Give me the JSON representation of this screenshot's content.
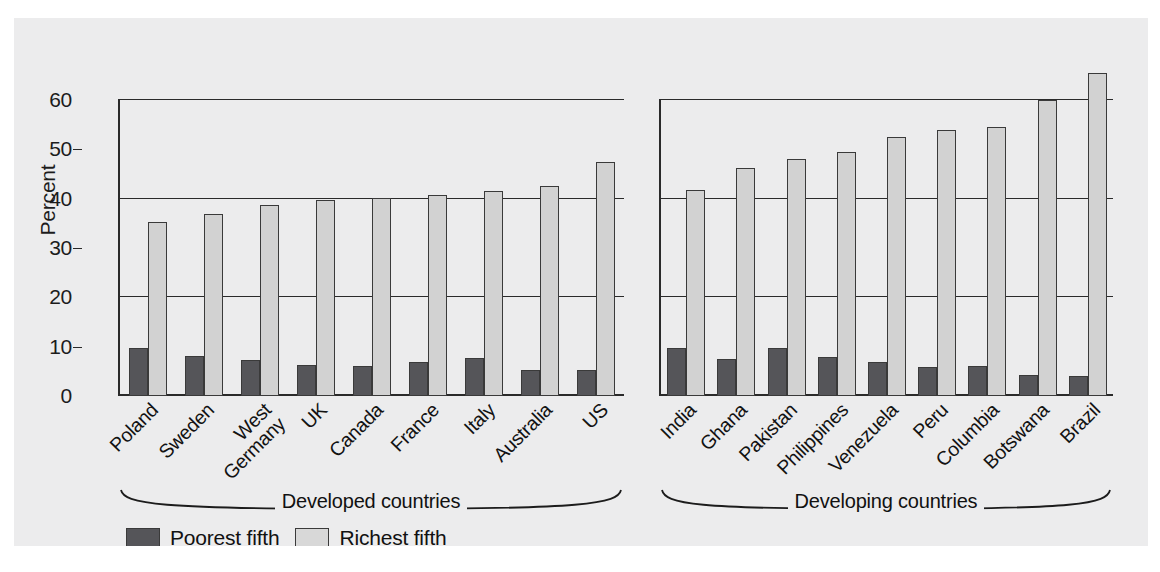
{
  "chart_data": {
    "type": "bar",
    "title": "",
    "xlabel": "",
    "ylabel": "Percent",
    "ylim": [
      0,
      60
    ],
    "yticks": [
      0,
      10,
      20,
      30,
      40,
      50,
      60
    ],
    "gridlines": [
      20,
      40,
      60
    ],
    "grid": true,
    "legend_position": "bottom-left",
    "series": [
      {
        "name": "Poorest fifth",
        "color": "#555559"
      },
      {
        "name": "Richest fifth",
        "color": "#d2d2d2"
      }
    ],
    "panels": [
      {
        "group_label": "Developed countries",
        "categories": [
          "Poland",
          "Sweden",
          "West Germany",
          "UK",
          "Canada",
          "France",
          "Italy",
          "Australia",
          "US"
        ],
        "poorest_fifth": [
          9.8,
          8.2,
          7.2,
          6.3,
          6.1,
          6.9,
          7.8,
          5.2,
          5.3
        ],
        "richest_fifth": [
          35.3,
          36.8,
          38.8,
          39.8,
          40.1,
          40.7,
          41.5,
          42.6,
          47.4
        ]
      },
      {
        "group_label": "Developing countries",
        "categories": [
          "India",
          "Ghana",
          "Pakistan",
          "Philippines",
          "Venezuela",
          "Peru",
          "Columbia",
          "Botswana",
          "Brazil"
        ],
        "poorest_fifth": [
          9.8,
          7.6,
          9.7,
          7.9,
          6.8,
          5.9,
          6.0,
          4.2,
          4.1
        ],
        "richest_fifth": [
          41.8,
          46.2,
          48.0,
          49.5,
          52.5,
          54.0,
          54.5,
          60.0,
          65.5
        ]
      }
    ]
  },
  "axis": {
    "ylabel": "Percent",
    "tick_labels": [
      "0",
      "10",
      "20",
      "30",
      "40",
      "50",
      "60"
    ]
  },
  "legend": {
    "items": [
      {
        "label": "Poorest fifth",
        "color": "#555559"
      },
      {
        "label": "Richest fifth",
        "color": "#d8d8d8"
      }
    ]
  },
  "groups": {
    "left_caption": "Developed countries",
    "right_caption": "Developing countries"
  },
  "colors": {
    "background": "#ececed",
    "page": "#ffffff",
    "ink": "#1c1c1c",
    "poorest": "#555559",
    "richest": "#d2d2d2"
  }
}
